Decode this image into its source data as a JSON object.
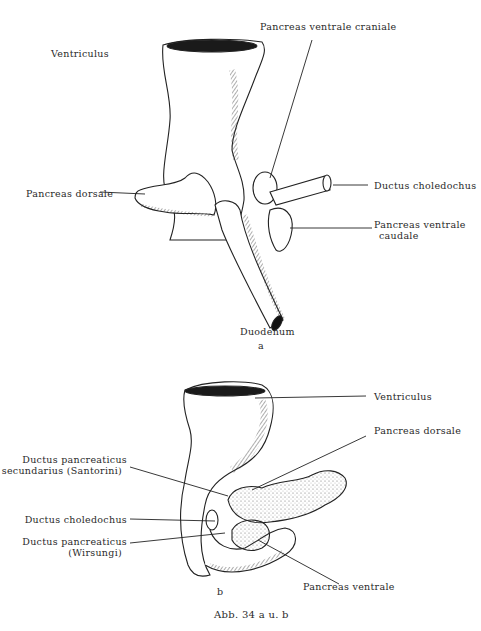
{
  "figure_a": {
    "panel_letter": "a",
    "labels": {
      "ventriculus": "Ventriculus",
      "pancreas_ventrale_craniale": "Pancreas ventrale craniale",
      "pancreas_dorsale": "Pancreas dorsale",
      "ductus_choledochus": "Ductus choledochus",
      "pancreas_ventrale_caudale_line1": "Pancreas ventrale",
      "pancreas_ventrale_caudale_line2": "caudale",
      "duodenum": "Duodenum"
    }
  },
  "figure_b": {
    "panel_letter": "b",
    "labels": {
      "ventriculus": "Ventriculus",
      "pancreas_dorsale": "Pancreas dorsale",
      "ductus_santorini_line1": "Ductus pancreaticus",
      "ductus_santorini_line2": "secundarius (Santorini)",
      "ductus_choledochus": "Ductus choledochus",
      "ductus_wirsungi_line1": "Ductus pancreaticus",
      "ductus_wirsungi_line2": "(Wirsungi)",
      "pancreas_ventrale": "Pancreas ventrale"
    }
  },
  "caption": "Abb. 34 a u. b",
  "colors": {
    "ink": "#2a2a2a",
    "paper": "#ffffff"
  }
}
